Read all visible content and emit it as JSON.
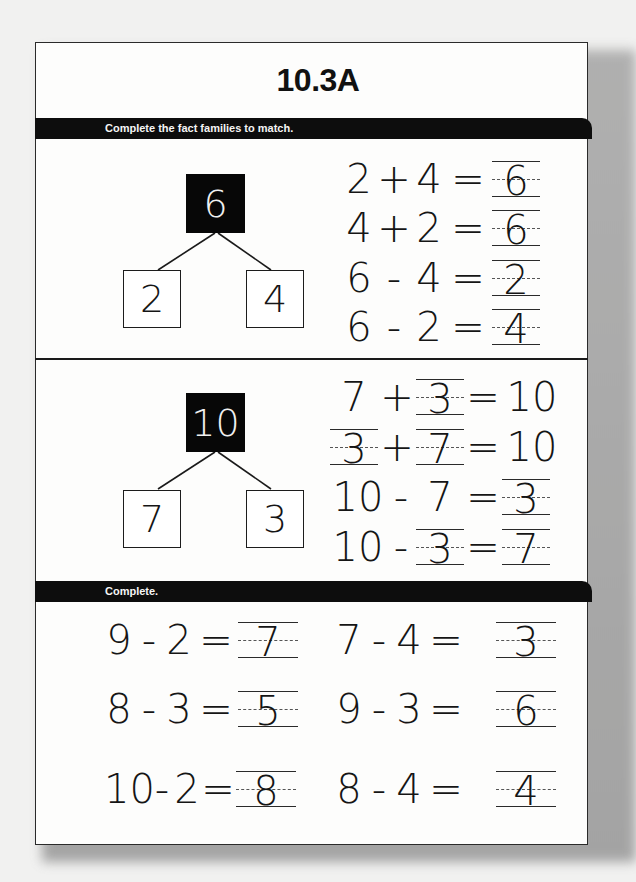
{
  "worksheet": {
    "title": "10.3A",
    "sections": [
      {
        "instruction": "Complete the fact families to match.",
        "fact_families": [
          {
            "whole": "6",
            "parts": [
              "2",
              "4"
            ],
            "equations": [
              {
                "a": "2",
                "op": "+",
                "b": "4",
                "eq": "=",
                "result": "6",
                "blank": "result"
              },
              {
                "a": "4",
                "op": "+",
                "b": "2",
                "eq": "=",
                "result": "6",
                "blank": "result"
              },
              {
                "a": "6",
                "op": "-",
                "b": "4",
                "eq": "=",
                "result": "2",
                "blank": "result"
              },
              {
                "a": "6",
                "op": "-",
                "b": "2",
                "eq": "=",
                "result": "4",
                "blank": "result"
              }
            ]
          },
          {
            "whole": "10",
            "parts": [
              "7",
              "3"
            ],
            "equations": [
              {
                "a": "7",
                "op": "+",
                "b": "3",
                "eq": "=",
                "result": "10",
                "blank": "b"
              },
              {
                "a": "3",
                "op": "+",
                "b": "7",
                "eq": "=",
                "result": "10",
                "blank": "a,b"
              },
              {
                "a": "10",
                "op": "-",
                "b": "7",
                "eq": "=",
                "result": "3",
                "blank": "result"
              },
              {
                "a": "10",
                "op": "-",
                "b": "3",
                "eq": "=",
                "result": "7",
                "blank": "b,result"
              }
            ]
          }
        ]
      },
      {
        "instruction": "Complete.",
        "problems": [
          {
            "a": "9",
            "op": "-",
            "b": "2",
            "eq": "=",
            "answer": "7"
          },
          {
            "a": "7",
            "op": "-",
            "b": "4",
            "eq": "=",
            "answer": "3"
          },
          {
            "a": "8",
            "op": "-",
            "b": "3",
            "eq": "=",
            "answer": "5"
          },
          {
            "a": "9",
            "op": "-",
            "b": "3",
            "eq": "=",
            "answer": "6"
          },
          {
            "a": "10",
            "op": "-",
            "b": "2",
            "eq": "=",
            "answer": "8"
          },
          {
            "a": "8",
            "op": "-",
            "b": "4",
            "eq": "=",
            "answer": "4"
          }
        ]
      }
    ]
  }
}
